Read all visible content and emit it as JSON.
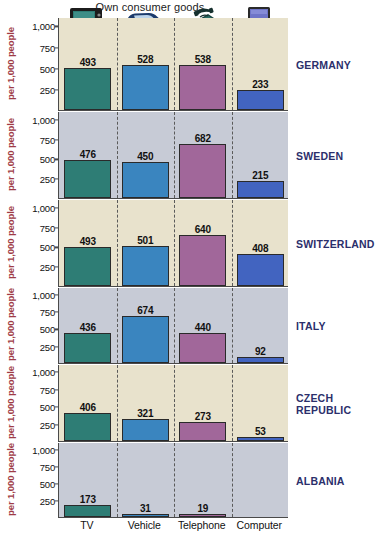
{
  "title": "Own consumer goods",
  "axis_caption": "per 1,000 people",
  "categories": [
    "TV",
    "Vehicle",
    "Telephone",
    "Computer"
  ],
  "category_icons": [
    "tv-icon",
    "car-icon",
    "telephone-icon",
    "computer-icon"
  ],
  "y_ticks": [
    "1,000",
    "750",
    "500",
    "250"
  ],
  "colors": {
    "tv_bar": "#2e7d75",
    "vehicle_bar": "#3a85bf",
    "telephone_bar": "#a1679a",
    "computer_bar": "#4264c0",
    "panel_cream": "#e8e2cc",
    "panel_grey": "#c7cbd6",
    "country_label": "#2b2f6b",
    "axis_caption": "#9e3b46"
  },
  "chart_data": {
    "type": "bar",
    "title": "Own consumer goods",
    "xlabel": "",
    "ylabel": "per 1,000 people",
    "ylim": [
      0,
      1000
    ],
    "yticks": [
      250,
      500,
      750,
      1000
    ],
    "grid": false,
    "legend": "none",
    "categories": [
      "TV",
      "Vehicle",
      "Telephone",
      "Computer"
    ],
    "panels": [
      {
        "name": "GERMANY",
        "background": "cream",
        "values": [
          493,
          528,
          538,
          233
        ]
      },
      {
        "name": "SWEDEN",
        "background": "grey",
        "values": [
          476,
          450,
          682,
          215
        ]
      },
      {
        "name": "SWITZERLAND",
        "background": "cream",
        "values": [
          493,
          501,
          640,
          408
        ]
      },
      {
        "name": "ITALY",
        "background": "grey",
        "values": [
          436,
          674,
          440,
          92
        ]
      },
      {
        "name": "CZECH REPUBLIC",
        "background": "cream",
        "values": [
          406,
          321,
          273,
          53
        ]
      },
      {
        "name": "ALBANIA",
        "background": "grey",
        "values": [
          173,
          31,
          19,
          0
        ]
      }
    ]
  },
  "panel_labels": [
    {
      "lines": [
        "GERMANY"
      ]
    },
    {
      "lines": [
        "SWEDEN"
      ]
    },
    {
      "lines": [
        "SWITZERLAND"
      ]
    },
    {
      "lines": [
        "ITALY"
      ]
    },
    {
      "lines": [
        "CZECH",
        "REPUBLIC"
      ]
    },
    {
      "lines": [
        "ALBANIA"
      ]
    }
  ]
}
